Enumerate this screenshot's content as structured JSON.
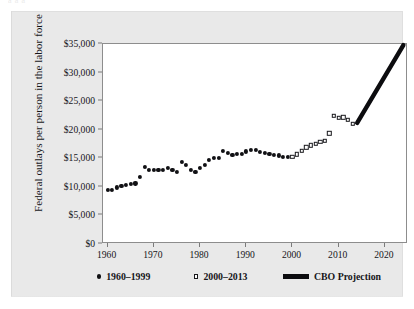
{
  "figure": {
    "top_cut_text": "a a a",
    "background_color": "#e9e9e9",
    "plot_background_color": "#ffffff",
    "marker_color": "#111114",
    "projection_color": "#0c0c0f"
  },
  "axes": {
    "ylabel": "Federal outlays per person in the labor force",
    "xlabel": "",
    "yticks": [
      "$0",
      "$5,000",
      "$10,000",
      "$15,000",
      "$20,000",
      "$25,000",
      "$30,000",
      "$35,000"
    ],
    "ytick_values": [
      0,
      5000,
      10000,
      15000,
      20000,
      25000,
      30000,
      35000
    ],
    "xticks": [
      "1960",
      "1970",
      "1980",
      "1990",
      "2000",
      "2010",
      "2020"
    ],
    "xtick_values": [
      1960,
      1970,
      1980,
      1990,
      2000,
      2010,
      2020
    ]
  },
  "legend": {
    "position": "below-axes",
    "items": [
      {
        "marker": "filled-circle",
        "label": "1960–1999"
      },
      {
        "marker": "open-square",
        "label": "2000–2013"
      },
      {
        "marker": "thick-line",
        "label": "CBO Projection"
      }
    ]
  },
  "chart_data": {
    "type": "scatter",
    "title": "",
    "xlabel": "",
    "ylabel": "Federal outlays per person in the labor force",
    "xlim": [
      1959,
      2025
    ],
    "ylim": [
      0,
      35000
    ],
    "grid": false,
    "legend_position": "below",
    "series": [
      {
        "name": "1960–1999",
        "marker": "filled-circle",
        "color": "#111114",
        "x": [
          1960,
          1961,
          1962,
          1963,
          1964,
          1965,
          1966,
          1967,
          1968,
          1969,
          1970,
          1971,
          1972,
          1973,
          1974,
          1975,
          1976,
          1977,
          1978,
          1979,
          1980,
          1981,
          1982,
          1983,
          1984,
          1985,
          1986,
          1987,
          1988,
          1989,
          1990,
          1991,
          1992,
          1993,
          1994,
          1995,
          1996,
          1997,
          1998,
          1999
        ],
        "y": [
          9400,
          9500,
          9900,
          10150,
          10350,
          10450,
          10600,
          11800,
          13500,
          13000,
          12950,
          12900,
          12950,
          13350,
          12900,
          12600,
          14300,
          13800,
          12900,
          12600,
          13300,
          13900,
          14700,
          15100,
          15100,
          16300,
          16000,
          15600,
          15700,
          15700,
          16200,
          16450,
          16400,
          16050,
          15900,
          15800,
          15600,
          15500,
          15300,
          15200
        ]
      },
      {
        "name": "2000–2013",
        "marker": "open-square",
        "color": "#18181c",
        "x": [
          2000,
          2001,
          2002,
          2003,
          2004,
          2005,
          2006,
          2007,
          2008,
          2009,
          2010,
          2011,
          2012,
          2013
        ],
        "y": [
          15250,
          15700,
          16300,
          16900,
          17300,
          17500,
          17900,
          18100,
          19400,
          22400,
          22100,
          22200,
          21700,
          21000
        ]
      },
      {
        "name": "CBO Projection",
        "marker": "thick-line",
        "color": "#0c0c0f",
        "x": [
          2014,
          2024
        ],
        "y": [
          21200,
          34800
        ]
      }
    ]
  }
}
